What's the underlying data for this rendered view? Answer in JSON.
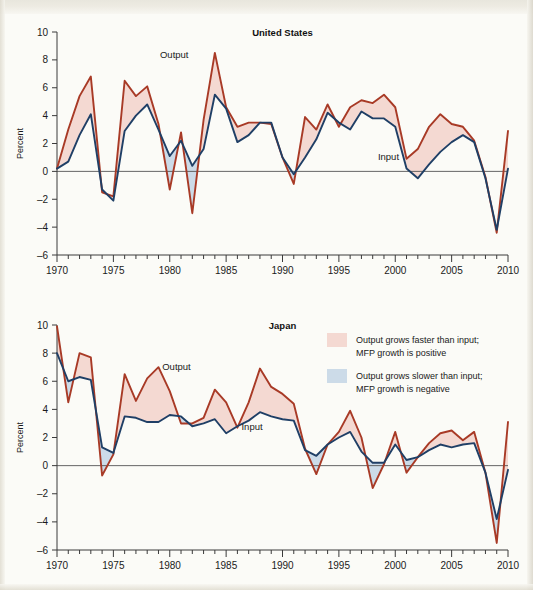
{
  "figure": {
    "background_color": "#fbfbf7",
    "output_color": "#a83a26",
    "input_color": "#1f3f66",
    "positive_fill": "#f4d9d2",
    "negative_fill": "#ccdbe8"
  },
  "legend": {
    "items": [
      {
        "swatch_color": "#f4d9d2",
        "line1": "Output grows faster than input;",
        "line2": "MFP growth is positive"
      },
      {
        "swatch_color": "#ccdbe8",
        "line1": "Output grows slower than input;",
        "line2": "MFP growth is negative"
      }
    ]
  },
  "chart_data": [
    {
      "type": "line",
      "title": "United States",
      "xlabel": "",
      "ylabel": "Percent",
      "xlim": [
        1970,
        2010
      ],
      "ylim": [
        -6,
        10
      ],
      "yticks": [
        -6,
        -4,
        -2,
        0,
        2,
        4,
        6,
        8,
        10
      ],
      "ytick_labels": [
        "–6",
        "–4",
        "–2",
        "0",
        "2",
        "4",
        "6",
        "8",
        "10"
      ],
      "xticks": [
        1970,
        1975,
        1980,
        1985,
        1990,
        1995,
        2000,
        2005,
        2010
      ],
      "xtick_labels": [
        "1970",
        "1975",
        "1980",
        "1985",
        "1990",
        "1995",
        "2000",
        "2005",
        "2010"
      ],
      "minor_xticks": true,
      "grid": false,
      "legend_position": "inline-annotations",
      "annotations": [
        {
          "text": "Output",
          "x": 1980.4,
          "y": 8.1
        },
        {
          "text": "Input",
          "x": 1999.4,
          "y": 0.85
        }
      ],
      "x": [
        1970,
        1971,
        1972,
        1973,
        1974,
        1975,
        1976,
        1977,
        1978,
        1979,
        1980,
        1981,
        1982,
        1983,
        1984,
        1985,
        1986,
        1987,
        1988,
        1989,
        1990,
        1991,
        1992,
        1993,
        1994,
        1995,
        1996,
        1997,
        1998,
        1999,
        2000,
        2001,
        2002,
        2003,
        2004,
        2005,
        2006,
        2007,
        2008,
        2009,
        2010
      ],
      "series": [
        {
          "name": "Output",
          "color": "#a83a26",
          "values": [
            0.2,
            3.0,
            5.4,
            6.8,
            -1.5,
            -1.8,
            6.5,
            5.4,
            6.1,
            3.4,
            -1.3,
            2.8,
            -3.0,
            3.7,
            8.5,
            4.6,
            3.2,
            3.5,
            3.5,
            3.4,
            1.0,
            -0.9,
            3.9,
            3.0,
            4.8,
            3.2,
            4.6,
            5.1,
            4.9,
            5.5,
            4.6,
            0.9,
            1.6,
            3.2,
            4.1,
            3.4,
            3.2,
            2.2,
            -0.4,
            -4.4,
            2.9
          ]
        },
        {
          "name": "Input",
          "color": "#1f3f66",
          "values": [
            0.2,
            0.7,
            2.6,
            4.1,
            -1.3,
            -2.1,
            2.9,
            4.0,
            4.8,
            3.0,
            1.1,
            2.2,
            0.4,
            1.6,
            5.5,
            4.5,
            2.1,
            2.6,
            3.5,
            3.5,
            1.0,
            -0.2,
            1.0,
            2.3,
            4.2,
            3.5,
            3.0,
            4.3,
            3.8,
            3.8,
            3.2,
            0.2,
            -0.5,
            0.5,
            1.4,
            2.1,
            2.6,
            2.1,
            -0.5,
            -4.2,
            0.2
          ]
        }
      ]
    },
    {
      "type": "line",
      "title": "Japan",
      "xlabel": "",
      "ylabel": "Percent",
      "xlim": [
        1970,
        2010
      ],
      "ylim": [
        -6,
        10
      ],
      "yticks": [
        -6,
        -4,
        -2,
        0,
        2,
        4,
        6,
        8,
        10
      ],
      "ytick_labels": [
        "–6",
        "–4",
        "–2",
        "0",
        "2",
        "4",
        "6",
        "8",
        "10"
      ],
      "xticks": [
        1970,
        1975,
        1980,
        1985,
        1990,
        1995,
        2000,
        2005,
        2010
      ],
      "xtick_labels": [
        "1970",
        "1975",
        "1980",
        "1985",
        "1990",
        "1995",
        "2000",
        "2005",
        "2010"
      ],
      "minor_xticks": true,
      "grid": false,
      "legend_position": "upper-right",
      "annotations": [
        {
          "text": "Output",
          "x": 1980.6,
          "y": 6.8
        },
        {
          "text": "Input",
          "x": 1987.3,
          "y": 2.5
        }
      ],
      "x": [
        1970,
        1971,
        1972,
        1973,
        1974,
        1975,
        1976,
        1977,
        1978,
        1979,
        1980,
        1981,
        1982,
        1983,
        1984,
        1985,
        1986,
        1987,
        1988,
        1989,
        1990,
        1991,
        1992,
        1993,
        1994,
        1995,
        1996,
        1997,
        1998,
        1999,
        2000,
        2001,
        2002,
        2003,
        2004,
        2005,
        2006,
        2007,
        2008,
        2009,
        2010
      ],
      "series": [
        {
          "name": "Output",
          "color": "#a83a26",
          "values": [
            9.9,
            4.5,
            8.0,
            7.7,
            -0.7,
            0.8,
            6.5,
            4.6,
            6.2,
            7.0,
            5.3,
            3.0,
            3.0,
            3.4,
            5.4,
            4.5,
            2.7,
            4.5,
            6.9,
            5.6,
            5.1,
            4.4,
            1.2,
            -0.6,
            1.5,
            2.4,
            3.9,
            2.0,
            -1.6,
            0.1,
            2.4,
            -0.5,
            0.6,
            1.6,
            2.3,
            2.5,
            1.8,
            2.4,
            -0.5,
            -5.5,
            3.1
          ]
        },
        {
          "name": "Input",
          "color": "#1f3f66",
          "values": [
            8.0,
            6.0,
            6.3,
            6.1,
            1.3,
            0.9,
            3.5,
            3.4,
            3.1,
            3.1,
            3.6,
            3.5,
            2.8,
            3.0,
            3.3,
            2.3,
            2.8,
            3.2,
            3.8,
            3.5,
            3.3,
            3.2,
            1.1,
            0.7,
            1.5,
            2.0,
            2.4,
            1.0,
            0.2,
            0.2,
            1.5,
            0.4,
            0.6,
            1.1,
            1.5,
            1.3,
            1.5,
            1.6,
            -0.5,
            -3.8,
            -0.3
          ]
        }
      ]
    }
  ]
}
